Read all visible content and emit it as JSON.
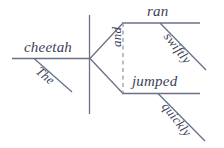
{
  "diagram": {
    "type": "reed-kellogg-sentence-diagram",
    "sentence": "The cheetah ran swiftly and jumped quickly",
    "line_color": "#6b7088",
    "text_color": "#3b3f59",
    "background_color": "#ffffff",
    "labels": {
      "subject": "cheetah",
      "article": "The",
      "conjunction": "and",
      "verb_one": "ran",
      "adverb_one": "swiftly",
      "verb_two": "jumped",
      "adverb_two": "quickly"
    }
  }
}
